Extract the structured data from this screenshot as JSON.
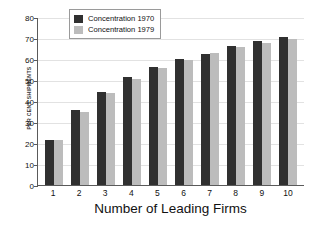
{
  "chart_data": {
    "type": "bar",
    "title": "",
    "xlabel": "Number of Leading Firms",
    "ylabel": "PER CENT SHIPMENTS",
    "categories": [
      "1",
      "2",
      "3",
      "4",
      "5",
      "6",
      "7",
      "8",
      "9",
      "10"
    ],
    "series": [
      {
        "name": "Concentration 1970",
        "color": "#303030",
        "values": [
          21.5,
          35.5,
          44.5,
          51.5,
          56.0,
          60.0,
          62.5,
          66.0,
          68.5,
          70.5
        ]
      },
      {
        "name": "Concentration 1979",
        "color": "#bcbcbc",
        "values": [
          21.5,
          35.0,
          44.0,
          50.5,
          55.5,
          59.5,
          63.0,
          65.5,
          67.5,
          69.5
        ]
      }
    ],
    "ylim": [
      0,
      80
    ],
    "yticks": [
      0,
      10,
      20,
      30,
      40,
      50,
      60,
      70,
      80
    ],
    "xlim_categories": 10,
    "grid": true,
    "legend_position": "top-center"
  },
  "legend": {
    "entries": [
      {
        "label": "Concentration 1970"
      },
      {
        "label": "Concentration 1979"
      }
    ]
  }
}
